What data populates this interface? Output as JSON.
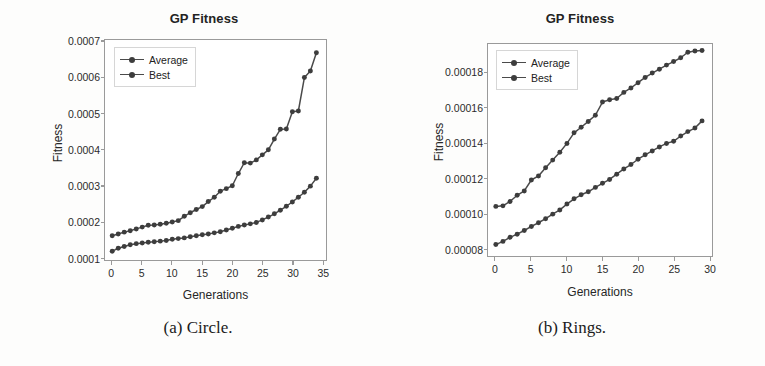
{
  "figure": {
    "background_color": "#fdfdfc",
    "line_color": "#4a4a4a",
    "marker_color": "#3d3d3d",
    "frame_color": "#9a9a9a"
  },
  "subfigures": [
    {
      "caption": "(a) Circle.",
      "caption_letter": "(a)",
      "caption_text": "Circle."
    },
    {
      "caption": "(b) Rings.",
      "caption_letter": "(b)",
      "caption_text": "Rings."
    }
  ],
  "chart_data": [
    {
      "type": "line",
      "title": "GP Fitness",
      "xlabel": "Generations",
      "ylabel": "Fitness",
      "xlim": [
        -1.2,
        35.6
      ],
      "ylim": [
        9.35e-05,
        0.0007055
      ],
      "xticks": [
        0,
        5,
        10,
        15,
        20,
        25,
        30,
        35
      ],
      "xticklabels": [
        "0",
        "5",
        "10",
        "15",
        "20",
        "25",
        "30",
        "35"
      ],
      "yticks": [
        0.0001,
        0.0002,
        0.0003,
        0.0004,
        0.0005,
        0.0006,
        0.0007
      ],
      "yticklabels": [
        "0.0001",
        "0.0002",
        "0.0003",
        "0.0004",
        "0.0005",
        "0.0006",
        "0.0007"
      ],
      "grid": false,
      "legend_position": "upper left",
      "legend": [
        "Average",
        "Best"
      ],
      "x": [
        0,
        1,
        2,
        3,
        4,
        5,
        6,
        7,
        8,
        9,
        10,
        11,
        12,
        13,
        14,
        15,
        16,
        17,
        18,
        19,
        20,
        21,
        22,
        23,
        24,
        25,
        26,
        27,
        28,
        29,
        30,
        31,
        32,
        33,
        34
      ],
      "series": [
        {
          "name": "Average",
          "values": [
            0.000118,
            0.000126,
            0.000131,
            0.000136,
            0.000139,
            0.000141,
            0.000143,
            0.000144,
            0.000146,
            0.000148,
            0.000151,
            0.000153,
            0.000155,
            0.000158,
            0.000161,
            0.000164,
            0.000166,
            0.000169,
            0.000172,
            0.000177,
            0.000182,
            0.000187,
            0.000191,
            0.000194,
            0.000198,
            0.000205,
            0.000213,
            0.000222,
            0.000232,
            0.000243,
            0.000255,
            0.000268,
            0.000282,
            0.000299,
            0.000321
          ]
        },
        {
          "name": "Best",
          "values": [
            0.000161,
            0.000166,
            0.000171,
            0.000175,
            0.00018,
            0.000185,
            0.00019,
            0.000191,
            0.000193,
            0.000196,
            0.000199,
            0.000203,
            0.000215,
            0.000225,
            0.000234,
            0.000242,
            0.000256,
            0.000268,
            0.000285,
            0.000292,
            0.0003,
            0.000334,
            0.000364,
            0.000363,
            0.000372,
            0.000386,
            0.0004,
            0.00043,
            0.000457,
            0.000458,
            0.000506,
            0.000508,
            0.000601,
            0.000619,
            0.00067
          ]
        }
      ]
    },
    {
      "type": "line",
      "title": "GP Fitness",
      "xlabel": "Generations",
      "ylabel": "Fitness",
      "xlim": [
        -1.1,
        30.4
      ],
      "ylim": [
        7.6e-05,
        0.0001965
      ],
      "xticks": [
        0,
        5,
        10,
        15,
        20,
        25,
        30
      ],
      "xticklabels": [
        "0",
        "5",
        "10",
        "15",
        "20",
        "25",
        "30"
      ],
      "yticks": [
        8e-05,
        0.0001,
        0.00012,
        0.00014,
        0.00016,
        0.00018
      ],
      "yticklabels": [
        "0.00008",
        "0.00010",
        "0.00012",
        "0.00014",
        "0.00016",
        "0.00018"
      ],
      "grid": false,
      "legend_position": "upper left",
      "legend": [
        "Average",
        "Best"
      ],
      "x": [
        0,
        1,
        2,
        3,
        4,
        5,
        6,
        7,
        8,
        9,
        10,
        11,
        12,
        13,
        14,
        15,
        16,
        17,
        18,
        19,
        20,
        21,
        22,
        23,
        24,
        25,
        26,
        27,
        28,
        29
      ],
      "series": [
        {
          "name": "Average",
          "values": [
            8.25e-05,
            8.43e-05,
            8.66e-05,
            8.84e-05,
            9.05e-05,
            9.28e-05,
            9.49e-05,
            9.72e-05,
            9.98e-05,
            0.0001022,
            0.0001055,
            0.0001085,
            0.0001108,
            0.0001125,
            0.000115,
            0.0001173,
            0.0001195,
            0.0001225,
            0.0001255,
            0.000128,
            0.000131,
            0.0001335,
            0.0001357,
            0.000138,
            0.00014,
            0.0001412,
            0.0001442,
            0.0001467,
            0.0001487,
            0.0001528
          ]
        },
        {
          "name": "Best",
          "values": [
            0.0001042,
            0.0001045,
            0.000107,
            0.0001105,
            0.000113,
            0.0001192,
            0.0001215,
            0.0001262,
            0.0001305,
            0.000135,
            0.00014,
            0.000146,
            0.0001492,
            0.0001525,
            0.000156,
            0.0001635,
            0.0001648,
            0.0001655,
            0.000169,
            0.0001715,
            0.0001745,
            0.0001775,
            0.00018,
            0.0001822,
            0.0001845,
            0.0001865,
            0.0001887,
            0.0001918,
            0.0001925,
            0.0001928
          ]
        }
      ]
    }
  ]
}
